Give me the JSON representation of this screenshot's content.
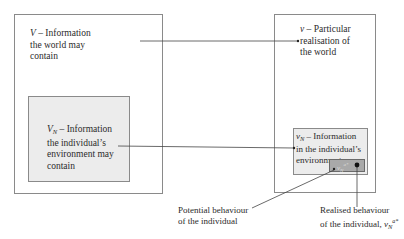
{
  "diagram": {
    "world_box": {
      "symbol": "V",
      "label": " – Information",
      "lines": [
        "the world may",
        "contain"
      ]
    },
    "env_box": {
      "symbol": "V",
      "subscript": "N",
      "label": " – Information",
      "lines": [
        "the individual’s",
        "environment may",
        "contain"
      ]
    },
    "realisation_box": {
      "symbol": "v",
      "label": " – Particular",
      "lines": [
        "realisation of",
        "the world"
      ]
    },
    "realised_env_box": {
      "symbol": "v",
      "subscript": "N",
      "label": " – Information",
      "lines": [
        "in the individual’s",
        "environment"
      ]
    },
    "behaviour_box": {
      "symbol": "v",
      "subscript": "N",
      "superscript": "a*"
    },
    "callouts": {
      "potential": [
        "Potential behaviour",
        "of the individual"
      ],
      "realised": [
        "Realised behaviour",
        "of the individual,"
      ],
      "realised_symbol": "v",
      "realised_subscript": "N",
      "realised_superscript": "a*"
    },
    "colors": {
      "border": "#8a8a8a",
      "shaded": "#ececec",
      "dark": "#a9a9a9",
      "line": "#444444"
    }
  }
}
